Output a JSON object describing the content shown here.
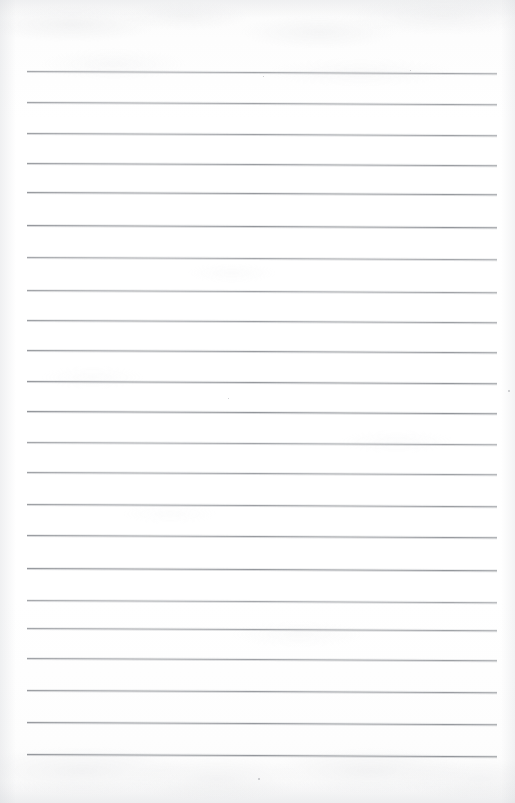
{
  "document": {
    "kind": "scanned-ruled-notebook-page",
    "title": "Blank Ruled Notebook Page",
    "page_label": "",
    "written_content": "",
    "page_width_px": 515,
    "page_height_px": 803,
    "paper_color": "#ffffff",
    "rule_color": "#8e9196",
    "edge_shadow_color": "#d6d8dc",
    "texture_color": "#c4c6ca"
  },
  "ruling": {
    "line_count": 23,
    "left_margin_px": 27,
    "right_margin_px": 497,
    "line_width_px": 470,
    "first_line_y_px": 71,
    "line_spacing_px": 31.1,
    "skew_degrees": 0.28,
    "has_vertical_margin_rule": false,
    "has_holes": false,
    "line_positions_y_px": [
      71,
      102,
      133,
      163,
      192,
      225,
      257,
      290,
      320,
      350,
      381,
      411,
      442,
      472,
      504,
      535,
      568,
      600,
      628,
      658,
      690,
      722,
      754
    ]
  },
  "artifacts": {
    "specks": [
      {
        "x_px": 508,
        "y_px": 390,
        "size_px": 2
      },
      {
        "x_px": 258,
        "y_px": 778,
        "size_px": 2
      },
      {
        "x_px": 263,
        "y_px": 76,
        "size_px": 1
      },
      {
        "x_px": 410,
        "y_px": 70,
        "size_px": 1
      },
      {
        "x_px": 228,
        "y_px": 398,
        "size_px": 1
      }
    ],
    "note": "faint mottled show-through and scanner edge shading"
  }
}
